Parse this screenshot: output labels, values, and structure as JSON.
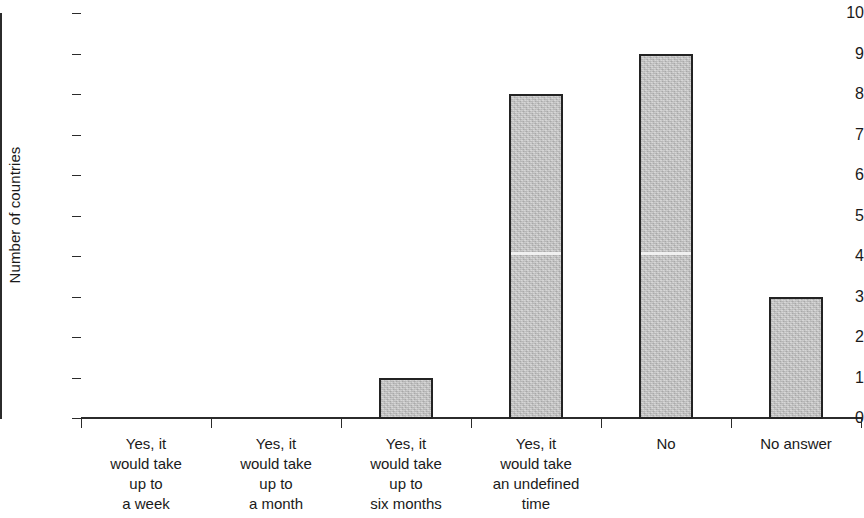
{
  "chart_data": {
    "type": "bar",
    "title": "",
    "xlabel": "",
    "ylabel": "Number of countries",
    "categories": [
      "Yes, it\nwould take\nup to\na week",
      "Yes, it\nwould take\nup to\na month",
      "Yes, it\nwould take\nup to\nsix months",
      "Yes, it\nwould take\nan undefined\ntime",
      "No",
      "No answer"
    ],
    "values": [
      0,
      0,
      1,
      8,
      9,
      3
    ],
    "ylim": [
      0,
      10
    ],
    "ytick_labels": [
      "0",
      "1",
      "2",
      "3",
      "4",
      "5",
      "6",
      "7",
      "8",
      "9",
      "10"
    ],
    "ytick_values": [
      0,
      1,
      2,
      3,
      4,
      5,
      6,
      7,
      8,
      9,
      10
    ],
    "grid": false,
    "legend": null,
    "bar_fill_color": "#c6c6c6",
    "bar_edge_color": "#232323",
    "axis_color": "#2b2b2b",
    "background_color": "#ffffff"
  }
}
